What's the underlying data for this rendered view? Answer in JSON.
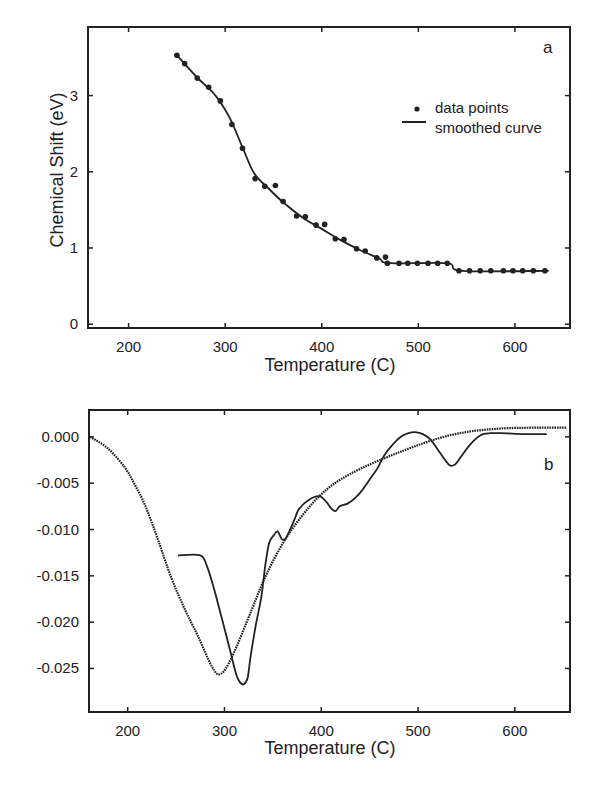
{
  "chart_data": [
    {
      "id": "a",
      "type": "scatter",
      "panel_label": "a",
      "title": "",
      "xlabel": "Temperature (C)",
      "ylabel": "Chemical  Shift  (eV)",
      "xlim": [
        158,
        657
      ],
      "ylim": [
        -0.05,
        3.9
      ],
      "xticks": [
        200,
        300,
        400,
        500,
        600
      ],
      "yticks": [
        0,
        1,
        2,
        3
      ],
      "grid": false,
      "legend": {
        "position": "upper right",
        "entries": [
          {
            "label": "data points",
            "marker": "dot"
          },
          {
            "label": "smoothed curve",
            "marker": "line"
          }
        ]
      },
      "series": [
        {
          "name": "data points",
          "kind": "points",
          "x": [
            250,
            258,
            271,
            283,
            295,
            307,
            318,
            331,
            341,
            352,
            360,
            374,
            383,
            394,
            403,
            414,
            423,
            436,
            445,
            457,
            466,
            468,
            480,
            489,
            499,
            510,
            520,
            530,
            542,
            553,
            564,
            575,
            588,
            598,
            608,
            619,
            631
          ],
          "y": [
            3.53,
            3.42,
            3.23,
            3.11,
            2.93,
            2.62,
            2.31,
            1.91,
            1.81,
            1.82,
            1.61,
            1.42,
            1.41,
            1.3,
            1.31,
            1.12,
            1.11,
            0.99,
            0.96,
            0.87,
            0.88,
            0.8,
            0.8,
            0.8,
            0.8,
            0.8,
            0.8,
            0.8,
            0.7,
            0.7,
            0.7,
            0.7,
            0.7,
            0.7,
            0.7,
            0.7,
            0.7
          ]
        },
        {
          "name": "smoothed curve",
          "kind": "line",
          "x": [
            250,
            270,
            290,
            305,
            318,
            330,
            345,
            360,
            380,
            400,
            420,
            440,
            460,
            470,
            530,
            545,
            635
          ],
          "y": [
            3.53,
            3.25,
            3.0,
            2.7,
            2.32,
            1.98,
            1.78,
            1.6,
            1.4,
            1.25,
            1.1,
            0.97,
            0.86,
            0.8,
            0.8,
            0.7,
            0.7
          ]
        }
      ]
    },
    {
      "id": "b",
      "type": "line",
      "panel_label": "b",
      "title": "",
      "xlabel": "Temperature (C)",
      "ylabel": "",
      "xlim": [
        160,
        657
      ],
      "ylim": [
        -0.0297,
        0.0029
      ],
      "xticks": [
        200,
        300,
        400,
        500,
        600
      ],
      "yticks": [
        0.0,
        -0.005,
        -0.01,
        -0.015,
        -0.02,
        -0.025
      ],
      "ytick_labels": [
        "0.000",
        "-0.005",
        "-0.010",
        "-0.015",
        "-0.020",
        "-0.025"
      ],
      "grid": false,
      "legend": null,
      "series": [
        {
          "name": "smooth derivative (dotted)",
          "kind": "dotted",
          "x": [
            161,
            179,
            197,
            207,
            218,
            231,
            245,
            259,
            273,
            287,
            296,
            308,
            328,
            344,
            367,
            398,
            430,
            482,
            534,
            586,
            654
          ],
          "y": [
            0.0,
            -0.0012,
            -0.0033,
            -0.0051,
            -0.0074,
            -0.011,
            -0.0152,
            -0.0186,
            -0.0216,
            -0.0248,
            -0.0256,
            -0.0237,
            -0.0187,
            -0.0147,
            -0.0104,
            -0.0064,
            -0.004,
            -0.0016,
            0.0002,
            0.0009,
            0.001
          ]
        },
        {
          "name": "measured derivative (solid)",
          "kind": "solid",
          "x": [
            252,
            275,
            282,
            289,
            297,
            305,
            312,
            316,
            320,
            324,
            327,
            332,
            338,
            342,
            346,
            351,
            355,
            359,
            363,
            367,
            372,
            377,
            387,
            398,
            405,
            411,
            415,
            419,
            427,
            434,
            442,
            450,
            458,
            465,
            474,
            482,
            490,
            497,
            505,
            513,
            522,
            532,
            538,
            544,
            554,
            565,
            575,
            586,
            610,
            633
          ],
          "y": [
            -0.0128,
            -0.0128,
            -0.014,
            -0.0163,
            -0.0195,
            -0.0227,
            -0.0256,
            -0.0265,
            -0.0267,
            -0.026,
            -0.0237,
            -0.0205,
            -0.0173,
            -0.014,
            -0.0115,
            -0.0106,
            -0.0102,
            -0.011,
            -0.011,
            -0.0102,
            -0.009,
            -0.0078,
            -0.0068,
            -0.0064,
            -0.007,
            -0.0078,
            -0.008,
            -0.0075,
            -0.0072,
            -0.0067,
            -0.0058,
            -0.0046,
            -0.0034,
            -0.002,
            -0.0008,
            0.0,
            0.0004,
            0.0005,
            0.0003,
            -0.0003,
            -0.0016,
            -0.003,
            -0.003,
            -0.0022,
            -0.0008,
            0.0002,
            0.0004,
            0.0004,
            0.0003,
            0.0003
          ]
        }
      ]
    }
  ]
}
